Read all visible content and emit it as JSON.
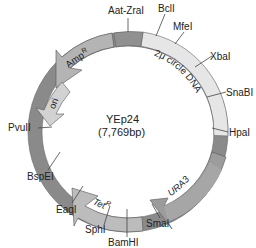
{
  "plasmid": {
    "name": "YEp24",
    "size": "(7,769bp)"
  },
  "segments": {
    "two_micron": {
      "label": "2μ circle DNA",
      "color": "#e4e4e4"
    },
    "ura3": {
      "label": "URA3",
      "color": "#9a9a9a"
    },
    "tet": {
      "label": "Tet",
      "sup": "R",
      "color": "#b8b8b8"
    },
    "amp": {
      "label": "Amp",
      "sup": "R",
      "color": "#b0b0b0"
    },
    "ori": {
      "label": "ori",
      "color": "#d0d0d0"
    },
    "backbone": {
      "color": "#8c8c8c"
    }
  },
  "sites": [
    {
      "name": "Aat-ZraI"
    },
    {
      "name": "BclI"
    },
    {
      "name": "MfeI"
    },
    {
      "name": "XbaI"
    },
    {
      "name": "SnaBI"
    },
    {
      "name": "HpaI"
    },
    {
      "name": "SmaI"
    },
    {
      "name": "BamHI"
    },
    {
      "name": "SphI"
    },
    {
      "name": "EagI"
    },
    {
      "name": "BspEI"
    },
    {
      "name": "PvuII"
    }
  ]
}
